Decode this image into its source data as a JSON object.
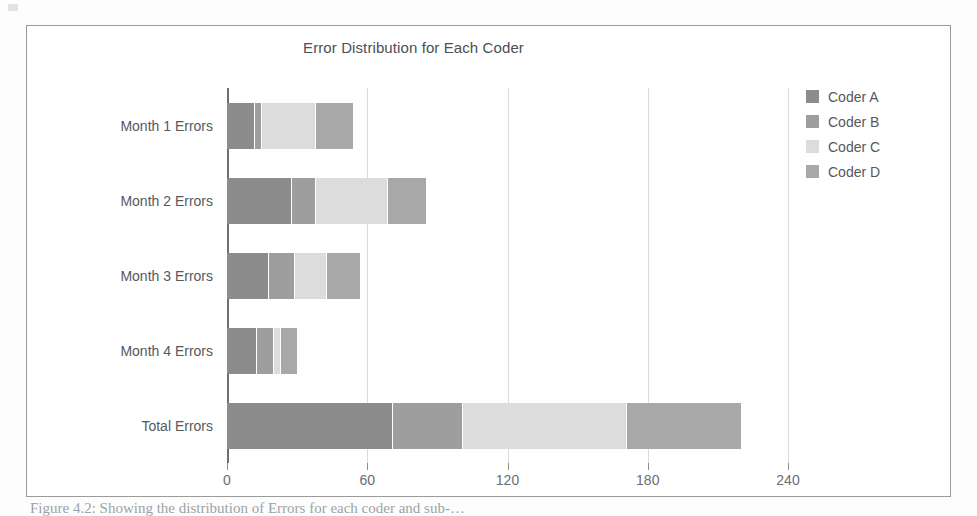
{
  "figure": {
    "caption": "Figure 4.2: Showing the distribution of Errors for each coder and sub-…"
  },
  "chart_data": {
    "type": "bar",
    "orientation": "horizontal",
    "stacked": true,
    "title": "Error Distribution for Each Coder",
    "xlabel": "",
    "ylabel": "",
    "xlim": [
      0,
      240
    ],
    "xticks": [
      0,
      60,
      120,
      180,
      240
    ],
    "xtick_labels": [
      "0",
      "60",
      "120",
      "180",
      "240"
    ],
    "grid": true,
    "legend_position": "right",
    "categories": [
      "Month 1 Errors",
      "Month 2 Errors",
      "Month 3 Errors",
      "Month 4 Errors",
      "Total Errors"
    ],
    "series": [
      {
        "name": "Coder A",
        "color": "#8c8c8c",
        "values": [
          12,
          28,
          18,
          13,
          71
        ]
      },
      {
        "name": "Coder B",
        "color": "#9e9e9e",
        "values": [
          3,
          10,
          11,
          7,
          30
        ]
      },
      {
        "name": "Coder C",
        "color": "#dcdcdc",
        "values": [
          23,
          31,
          14,
          3,
          70
        ]
      },
      {
        "name": "Coder D",
        "color": "#a8a8a8",
        "values": [
          16,
          16,
          14,
          7,
          49
        ]
      }
    ],
    "row_totals": [
      54,
      85,
      57,
      30,
      220
    ]
  }
}
